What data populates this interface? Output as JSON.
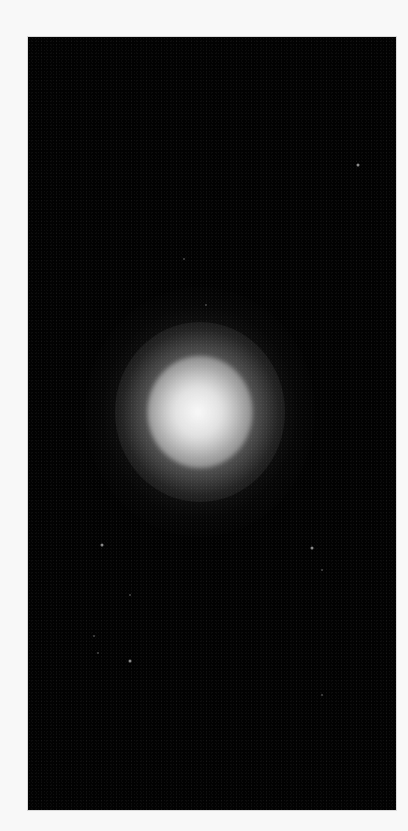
{
  "image": {
    "description": "Scanned photograph of a diffuse bright glowing blob centered on a black field with faint scattered specks",
    "background_color": "#f8f8f8",
    "panel_color": "#020202",
    "panel": {
      "x": 28,
      "y": 37,
      "width": 368,
      "height": 773
    },
    "glow": {
      "center_x": 172,
      "center_y": 375,
      "core_color": "#f5f5f5",
      "halo_color": "#6e6e6e"
    },
    "specks": [
      {
        "x": 330,
        "y": 128,
        "faint": false
      },
      {
        "x": 74,
        "y": 508,
        "faint": false
      },
      {
        "x": 284,
        "y": 511,
        "faint": false
      },
      {
        "x": 102,
        "y": 558,
        "faint": true
      },
      {
        "x": 66,
        "y": 599,
        "faint": true
      },
      {
        "x": 70,
        "y": 616,
        "faint": true
      },
      {
        "x": 102,
        "y": 624,
        "faint": false
      },
      {
        "x": 294,
        "y": 533,
        "faint": true
      },
      {
        "x": 294,
        "y": 658,
        "faint": true
      },
      {
        "x": 156,
        "y": 222,
        "faint": true
      },
      {
        "x": 178,
        "y": 268,
        "faint": true
      }
    ]
  }
}
